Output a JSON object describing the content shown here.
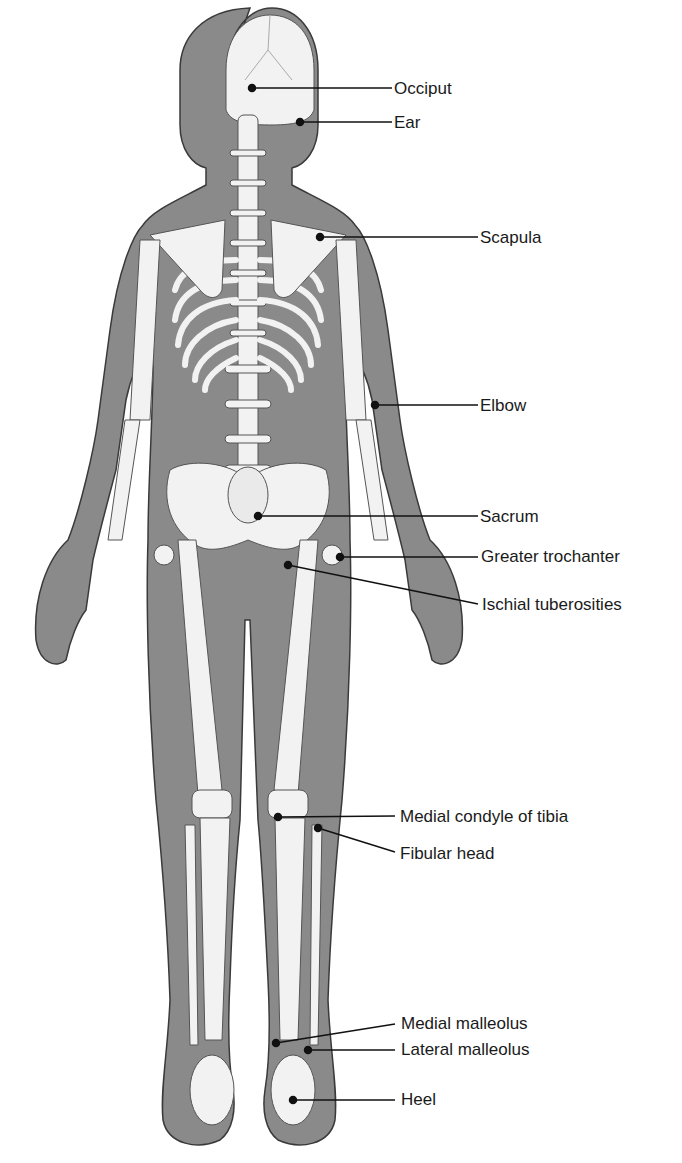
{
  "figure": {
    "colors": {
      "skin": "#8a8a8a",
      "skin_outline": "#3a3a3a",
      "bone": "#f2f2f2",
      "bone_outline": "#555555",
      "leader": "#111111",
      "text": "#1a1a1a"
    }
  },
  "labels": [
    {
      "id": "occiput",
      "text": "Occiput"
    },
    {
      "id": "ear",
      "text": "Ear"
    },
    {
      "id": "scapula",
      "text": "Scapula"
    },
    {
      "id": "elbow",
      "text": "Elbow"
    },
    {
      "id": "sacrum",
      "text": "Sacrum"
    },
    {
      "id": "greater-trochanter",
      "text": "Greater trochanter"
    },
    {
      "id": "ischial-tuberosities",
      "text": "Ischial tuberosities"
    },
    {
      "id": "medial-condyle-tibia",
      "text": "Medial condyle of tibia"
    },
    {
      "id": "fibular-head",
      "text": "Fibular head"
    },
    {
      "id": "medial-malleolus",
      "text": "Medial malleolus"
    },
    {
      "id": "lateral-malleolus",
      "text": "Lateral malleolus"
    },
    {
      "id": "heel",
      "text": "Heel"
    }
  ]
}
